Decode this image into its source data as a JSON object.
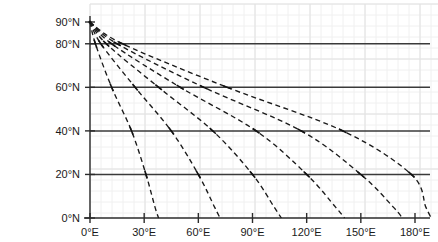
{
  "chart_data": {
    "type": "line",
    "title": "",
    "subtitle": "",
    "xlabel": "",
    "ylabel": "",
    "xlim": [
      0,
      180
    ],
    "ylim": [
      0,
      90
    ],
    "grid": true,
    "grid_style": "major latitude gridlines solid dark; faint background grid",
    "legend": false,
    "legend_position": "none",
    "line_style": "dashed",
    "line_color": "#1a1a1a",
    "marker_style": "cross-tick at latitude crossings",
    "x_tick_labels": [
      "0°E",
      "30°E",
      "60°E",
      "90°E",
      "120°E",
      "150°E",
      "180°E"
    ],
    "x_tick_values": [
      0,
      30,
      60,
      90,
      120,
      150,
      180
    ],
    "y_tick_labels": [
      "0°N",
      "20°N",
      "40°N",
      "60°N",
      "80°N",
      "90°N"
    ],
    "y_tick_values": [
      0,
      20,
      40,
      60,
      80,
      90
    ],
    "gridline_latitudes": [
      0,
      20,
      40,
      60,
      80,
      90
    ],
    "origin_point": {
      "x": 0,
      "y": 90,
      "label": "North Pole convergence"
    },
    "series": [
      {
        "name": "curve-1",
        "x": [
          0,
          3,
          12,
          23,
          31,
          36,
          38
        ],
        "y": [
          90,
          80,
          60,
          40,
          20,
          5,
          0
        ],
        "markers_at_latitudes": [
          80,
          60,
          40,
          20
        ]
      },
      {
        "name": "curve-2",
        "x": [
          0,
          6,
          25,
          45,
          60,
          69,
          72
        ],
        "y": [
          90,
          80,
          60,
          40,
          20,
          5,
          0
        ],
        "markers_at_latitudes": [
          80,
          60,
          40,
          20
        ]
      },
      {
        "name": "curve-3",
        "x": [
          0,
          9,
          38,
          68,
          90,
          102,
          106
        ],
        "y": [
          90,
          80,
          60,
          40,
          20,
          5,
          0
        ],
        "markers_at_latitudes": [
          80,
          60,
          40,
          20
        ]
      },
      {
        "name": "curve-4",
        "x": [
          0,
          12,
          50,
          92,
          120,
          136,
          141
        ],
        "y": [
          90,
          80,
          60,
          40,
          20,
          5,
          0
        ],
        "markers_at_latitudes": [
          80,
          60,
          40,
          20
        ]
      },
      {
        "name": "curve-5",
        "x": [
          0,
          15,
          63,
          117,
          150,
          168,
          173
        ],
        "y": [
          90,
          80,
          60,
          40,
          20,
          5,
          0
        ],
        "markers_at_latitudes": [
          80,
          60,
          40,
          20
        ]
      },
      {
        "name": "curve-6",
        "x": [
          0,
          18,
          76,
          140,
          178,
          186,
          189
        ],
        "y": [
          90,
          80,
          60,
          40,
          20,
          5,
          0
        ],
        "markers_at_latitudes": [
          80,
          60,
          40,
          20
        ]
      }
    ]
  }
}
